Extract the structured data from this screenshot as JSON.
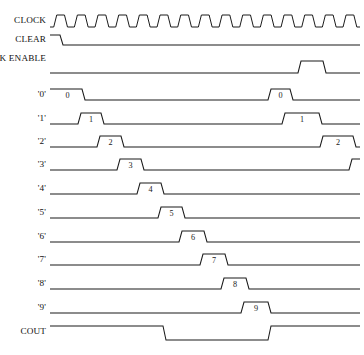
{
  "diagram": {
    "type": "digital-timing-diagram",
    "title": "",
    "background_color": "#ffffff",
    "line_color": "#1b1b1b",
    "text_color": "#111111",
    "width": 364,
    "height": 355,
    "time_axis": {
      "x_start": 50,
      "x_end": 360,
      "clock_period": 20.4,
      "clock_cycles": 15
    },
    "signals": [
      {
        "name": "CLOCK",
        "label": "CLOCK",
        "row": 0,
        "baseline_y": 27,
        "high_y": 15,
        "kind": "clock",
        "clock_cycles": 15,
        "initial_level": "low",
        "annotations": []
      },
      {
        "name": "CLEAR",
        "label": "CLEAR",
        "row": 1,
        "baseline_y": 45,
        "high_y": 35,
        "kind": "level",
        "initial_level": "high",
        "transitions": [
          {
            "x": 60,
            "to": "low"
          }
        ],
        "annotations": []
      },
      {
        "name": "CLOCK_ENABLE",
        "label": "CLOCK ENABLE",
        "row": 2,
        "baseline_y": 73,
        "high_y": 61,
        "kind": "pulse",
        "initial_level": "low",
        "pulses": [
          {
            "rise": 298,
            "fall": 323,
            "label": ""
          }
        ],
        "annotations": []
      },
      {
        "name": "Q0",
        "label": "'0'",
        "row": 3,
        "baseline_y": 100,
        "high_y": 89,
        "kind": "pulse",
        "initial_level": "high",
        "pulses": [
          {
            "rise": 50,
            "fall": 82,
            "label": "0"
          },
          {
            "rise": 268,
            "fall": 290,
            "label": "0"
          }
        ],
        "annotations": []
      },
      {
        "name": "Q1",
        "label": "'1'",
        "row": 4,
        "baseline_y": 124,
        "high_y": 113,
        "kind": "pulse",
        "initial_level": "low",
        "pulses": [
          {
            "rise": 78,
            "fall": 101,
            "label": "1"
          },
          {
            "rise": 282,
            "fall": 319,
            "label": "1"
          }
        ],
        "annotations": []
      },
      {
        "name": "Q2",
        "label": "'2'",
        "row": 5,
        "baseline_y": 147,
        "high_y": 136,
        "kind": "pulse",
        "initial_level": "low",
        "pulses": [
          {
            "rise": 97,
            "fall": 121,
            "label": "2"
          },
          {
            "rise": 320,
            "fall": 353,
            "label": "2"
          }
        ],
        "annotations": []
      },
      {
        "name": "Q3",
        "label": "'3'",
        "row": 6,
        "baseline_y": 170,
        "high_y": 159,
        "kind": "pulse",
        "initial_level": "low",
        "pulses": [
          {
            "rise": 117,
            "fall": 141,
            "label": "3"
          },
          {
            "rise": 349,
            "fall": 364,
            "label": ""
          }
        ],
        "annotations": []
      },
      {
        "name": "Q4",
        "label": "'4'",
        "row": 7,
        "baseline_y": 194,
        "high_y": 183,
        "kind": "pulse",
        "initial_level": "low",
        "pulses": [
          {
            "rise": 137,
            "fall": 161,
            "label": "4"
          }
        ],
        "annotations": []
      },
      {
        "name": "Q5",
        "label": "'5'",
        "row": 8,
        "baseline_y": 218,
        "high_y": 207,
        "kind": "pulse",
        "initial_level": "low",
        "pulses": [
          {
            "rise": 158,
            "fall": 182,
            "label": "5"
          }
        ],
        "annotations": []
      },
      {
        "name": "Q6",
        "label": "'6'",
        "row": 9,
        "baseline_y": 242,
        "high_y": 231,
        "kind": "pulse",
        "initial_level": "low",
        "pulses": [
          {
            "rise": 179,
            "fall": 204,
            "label": "6"
          }
        ],
        "annotations": []
      },
      {
        "name": "Q7",
        "label": "'7'",
        "row": 10,
        "baseline_y": 265,
        "high_y": 254,
        "kind": "pulse",
        "initial_level": "low",
        "pulses": [
          {
            "rise": 200,
            "fall": 225,
            "label": "7"
          }
        ],
        "annotations": []
      },
      {
        "name": "Q8",
        "label": "'8'",
        "row": 11,
        "baseline_y": 289,
        "high_y": 278,
        "kind": "pulse",
        "initial_level": "low",
        "pulses": [
          {
            "rise": 221,
            "fall": 246,
            "label": "8"
          }
        ],
        "annotations": []
      },
      {
        "name": "Q9",
        "label": "'9'",
        "row": 12,
        "baseline_y": 313,
        "high_y": 302,
        "kind": "pulse",
        "initial_level": "low",
        "pulses": [
          {
            "rise": 241,
            "fall": 268,
            "label": "9"
          }
        ],
        "annotations": []
      },
      {
        "name": "COUT",
        "label": "COUT",
        "row": 13,
        "baseline_y": 326,
        "high_y": 326,
        "low_y": 340,
        "kind": "inverted-pulse",
        "initial_level": "high",
        "pulses": [
          {
            "fall": 163,
            "rise": 268,
            "label": ""
          }
        ],
        "annotations": []
      }
    ],
    "labels": {
      "clock": "CLOCK",
      "clear": "CLEAR",
      "clock_enable": "CLOCK ENABLE",
      "q0": "'0'",
      "q1": "'1'",
      "q2": "'2'",
      "q3": "'3'",
      "q4": "'4'",
      "q5": "'5'",
      "q6": "'6'",
      "q7": "'7'",
      "q8": "'8'",
      "q9": "'9'",
      "cout": "COUT"
    }
  }
}
